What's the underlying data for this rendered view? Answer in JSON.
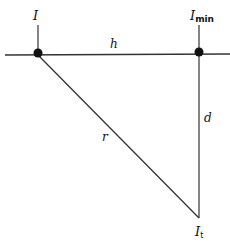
{
  "diagram": {
    "labels": {
      "source_left": "I",
      "source_right": "I",
      "source_right_sub": "min",
      "horizontal_distance": "h",
      "slant_distance": "r",
      "vertical_distance": "d",
      "target": "I",
      "target_sub": "t"
    },
    "colors": {
      "line": "#333333",
      "dot": "#111111",
      "background": "#ffffff"
    }
  }
}
